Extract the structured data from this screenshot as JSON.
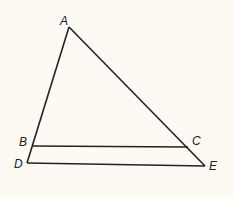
{
  "diagram": {
    "type": "triangle-with-parallel-segment",
    "background": "#fcfaf3",
    "stroke": "#222222",
    "points": {
      "A": {
        "label": "A",
        "x": 69,
        "y": 27,
        "lx": 60,
        "ly": 25
      },
      "B": {
        "label": "B",
        "x": 32,
        "y": 146,
        "lx": 19,
        "ly": 146
      },
      "C": {
        "label": "C",
        "x": 188,
        "y": 147,
        "lx": 192,
        "ly": 145
      },
      "D": {
        "label": "D",
        "x": 27,
        "y": 163,
        "lx": 14,
        "ly": 168
      },
      "E": {
        "label": "E",
        "x": 205,
        "y": 166,
        "lx": 209,
        "ly": 170
      }
    },
    "segments": [
      {
        "from": "A",
        "to": "D"
      },
      {
        "from": "A",
        "to": "E"
      },
      {
        "from": "B",
        "to": "C"
      },
      {
        "from": "D",
        "to": "E"
      }
    ]
  }
}
